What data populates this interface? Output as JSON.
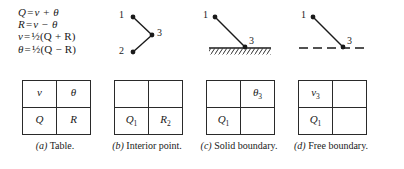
{
  "figure": {
    "equations": [
      {
        "lhs": "Q",
        "rel": "=",
        "rhs": "ν + θ"
      },
      {
        "lhs": "R",
        "rel": "=",
        "rhs": "ν − θ"
      },
      {
        "lhs": "ν",
        "rel": "=",
        "rhs": "½(Q + R)"
      },
      {
        "lhs": "θ",
        "rel": "=",
        "rhs": "½(Q − R)"
      }
    ],
    "diagrams": {
      "interior": {
        "name": "interior-point",
        "points": [
          {
            "label": "1",
            "x": 20,
            "y": 11
          },
          {
            "label": "2",
            "x": 20,
            "y": 46
          },
          {
            "label": "3",
            "x": 39,
            "y": 29
          }
        ],
        "label_positions": [
          {
            "label": "1",
            "x": 6,
            "y": 4
          },
          {
            "label": "2",
            "x": 6,
            "y": 40
          },
          {
            "label": "3",
            "x": 44,
            "y": 22
          }
        ]
      },
      "solid": {
        "name": "solid-boundary",
        "points": [
          {
            "label": "1",
            "x": 12,
            "y": 11
          },
          {
            "label": "3",
            "x": 42,
            "y": 41
          }
        ],
        "label_positions": [
          {
            "label": "1",
            "x": 0,
            "y": 4
          },
          {
            "label": "3",
            "x": 46,
            "y": 30
          }
        ],
        "boundary_type": "hatched-solid-line",
        "boundary_y": 42
      },
      "free": {
        "name": "free-boundary",
        "points": [
          {
            "label": "1",
            "x": 20,
            "y": 11
          },
          {
            "label": "3",
            "x": 50,
            "y": 41
          }
        ],
        "label_positions": [
          {
            "label": "1",
            "x": 8,
            "y": 4
          },
          {
            "label": "3",
            "x": 54,
            "y": 30
          }
        ],
        "boundary_type": "dashed-line",
        "boundary_y": 42
      }
    },
    "tables": {
      "a": {
        "name": "table-a",
        "cells": [
          [
            {
              "sym": "ν",
              "sub": ""
            },
            {
              "sym": "θ",
              "sub": ""
            }
          ],
          [
            {
              "sym": "Q",
              "sub": ""
            },
            {
              "sym": "R",
              "sub": ""
            }
          ]
        ]
      },
      "b": {
        "name": "table-b",
        "cells": [
          [
            {
              "sym": "",
              "sub": ""
            },
            {
              "sym": "",
              "sub": ""
            }
          ],
          [
            {
              "sym": "Q",
              "sub": "1"
            },
            {
              "sym": "R",
              "sub": "2"
            }
          ]
        ]
      },
      "c": {
        "name": "table-c",
        "cells": [
          [
            {
              "sym": "",
              "sub": ""
            },
            {
              "sym": "θ",
              "sub": "3"
            }
          ],
          [
            {
              "sym": "Q",
              "sub": "1"
            },
            {
              "sym": "",
              "sub": ""
            }
          ]
        ]
      },
      "d": {
        "name": "table-d",
        "cells": [
          [
            {
              "sym": "ν",
              "sub": "3"
            },
            {
              "sym": "",
              "sub": ""
            }
          ],
          [
            {
              "sym": "Q",
              "sub": "1"
            },
            {
              "sym": "",
              "sub": ""
            }
          ]
        ]
      }
    },
    "captions": [
      {
        "tag": "(a)",
        "text": "Table."
      },
      {
        "tag": "(b)",
        "text": "Interior point."
      },
      {
        "tag": "(c)",
        "text": "Solid boundary."
      },
      {
        "tag": "(d)",
        "text": "Free boundary."
      }
    ],
    "colors": {
      "ink": "#1a1a1a",
      "rule": "#2a2a2a",
      "background": "#ffffff"
    }
  }
}
